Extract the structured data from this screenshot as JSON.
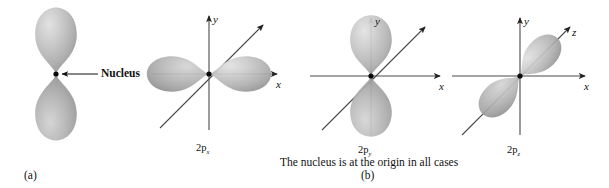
{
  "figure": {
    "background_color": "#ffffff",
    "ink_color": "#111111",
    "lobe_color_light": "#d8d8d8",
    "lobe_color_mid": "#b3b3b3",
    "lobe_color_dark": "#8e8e8e",
    "axis_color": "#555555",
    "caption": "The nucleus is at the origin in all cases",
    "panels": [
      {
        "id": "a",
        "label": "(a)"
      },
      {
        "id": "b",
        "label": "(b)"
      }
    ],
    "annotations": {
      "nucleus_label": "Nucleus"
    },
    "orbitals": [
      {
        "id": "generic-p",
        "name": "generic-p-orbital",
        "orientation": "vertical",
        "label": "",
        "subscript": "",
        "axes": [],
        "panel": "a"
      },
      {
        "id": "2px",
        "name": "2p-x-orbital",
        "orientation": "horizontal",
        "label": "2p",
        "subscript": "x",
        "axes": [
          "y",
          "x",
          "z"
        ],
        "panel": "b"
      },
      {
        "id": "2py",
        "name": "2p-y-orbital",
        "orientation": "vertical",
        "label": "2p",
        "subscript": "y",
        "axes": [
          "y",
          "x",
          "z"
        ],
        "panel": "b"
      },
      {
        "id": "2pz",
        "name": "2p-z-orbital",
        "orientation": "diagonal",
        "label": "2p",
        "subscript": "z",
        "axes": [
          "y",
          "x",
          "z"
        ],
        "panel": "b"
      }
    ],
    "axis_labels": {
      "x": "x",
      "y": "y",
      "z": "z"
    }
  }
}
